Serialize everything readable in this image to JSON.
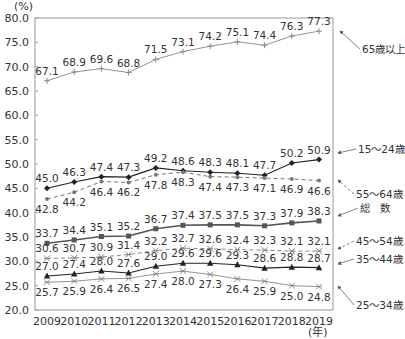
{
  "chart_data": {
    "type": "line",
    "title": "",
    "ylabel": "(%)",
    "xlabel": "(年)",
    "ylim": [
      20.0,
      80.0
    ],
    "ytick_step": 5.0,
    "yticks": [
      "20.0",
      "25.0",
      "30.0",
      "35.0",
      "40.0",
      "45.0",
      "50.0",
      "55.0",
      "60.0",
      "65.0",
      "70.0",
      "75.0",
      "80.0"
    ],
    "grid": false,
    "legend_position": "right, arrow callouts",
    "categories": [
      "2009",
      "2010",
      "2011",
      "2012",
      "2013",
      "2014",
      "2015",
      "2016",
      "2017",
      "2018",
      "2019"
    ],
    "series": [
      {
        "name": "65歳以上",
        "marker": "plus",
        "line": "solid-thin",
        "color": "#888888",
        "values": [
          67.1,
          68.9,
          69.6,
          68.8,
          71.5,
          73.1,
          74.2,
          75.1,
          74.4,
          76.3,
          77.3
        ]
      },
      {
        "name": "15～24歳",
        "marker": "diamond",
        "line": "solid",
        "color": "#222222",
        "values": [
          45.0,
          46.3,
          47.4,
          47.3,
          49.2,
          48.6,
          48.3,
          48.1,
          47.7,
          50.2,
          50.9
        ]
      },
      {
        "name": "55～64歳",
        "marker": "dot",
        "line": "dashed",
        "color": "#777777",
        "values": [
          42.8,
          44.2,
          46.4,
          46.2,
          47.8,
          48.3,
          47.4,
          47.3,
          47.1,
          46.9,
          46.6
        ]
      },
      {
        "name": "総　数",
        "marker": "square",
        "line": "solid-thick",
        "color": "#555555",
        "values": [
          33.7,
          34.4,
          35.1,
          35.2,
          36.7,
          37.4,
          37.5,
          37.5,
          37.3,
          37.9,
          38.3
        ]
      },
      {
        "name": "45～54歳",
        "marker": "asterisk",
        "line": "dashed",
        "color": "#888888",
        "values": [
          30.6,
          30.7,
          30.9,
          31.4,
          32.2,
          32.7,
          32.6,
          32.4,
          32.3,
          32.1,
          32.1
        ]
      },
      {
        "name": "35～44歳",
        "marker": "triangle",
        "line": "solid",
        "color": "#222222",
        "values": [
          27.0,
          27.4,
          28.0,
          27.6,
          29.0,
          29.6,
          29.6,
          29.3,
          28.6,
          28.8,
          28.7
        ]
      },
      {
        "name": "25～34歳",
        "marker": "x",
        "line": "solid-thin",
        "color": "#888888",
        "values": [
          25.7,
          25.9,
          26.4,
          26.5,
          27.4,
          28.0,
          27.3,
          26.4,
          25.9,
          25.0,
          24.8
        ]
      }
    ],
    "label_positions": {
      "65歳以上": "above",
      "15～24歳": "above",
      "55～64歳": "below",
      "総　数": "above",
      "45～54歳": "above",
      "35～44歳": "above",
      "25～34歳": "below"
    },
    "legend_callouts": [
      {
        "series": "65歳以上",
        "label": "65歳以上",
        "label_x": 362,
        "label_y": 53,
        "arrow_to_x": 340,
        "arrow_to_y": 31
      },
      {
        "series": "15～24歳",
        "label": "15～24歳",
        "label_x": 358,
        "label_y": 153,
        "arrow_to_x": 338,
        "arrow_to_y": 153
      },
      {
        "series": "55～64歳",
        "label": "55～64歳",
        "label_x": 356,
        "label_y": 198,
        "arrow_to_x": 338,
        "arrow_to_y": 180
      },
      {
        "series": "総　数",
        "label": "総　数",
        "label_x": 360,
        "label_y": 212,
        "arrow_to_x": 338,
        "arrow_to_y": 216
      },
      {
        "series": "45～54歳",
        "label": "45～54歳",
        "label_x": 356,
        "label_y": 245,
        "arrow_to_x": 338,
        "arrow_to_y": 249
      },
      {
        "series": "35～44歳",
        "label": "35～44歳",
        "label_x": 356,
        "label_y": 263,
        "arrow_to_x": 338,
        "arrow_to_y": 264
      },
      {
        "series": "25～34歳",
        "label": "25～34歳",
        "label_x": 356,
        "label_y": 309,
        "arrow_to_x": 338,
        "arrow_to_y": 286
      }
    ]
  }
}
